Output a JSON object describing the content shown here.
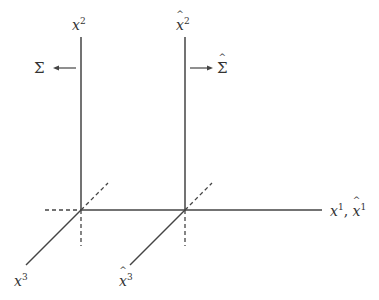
{
  "diagram": {
    "colors": {
      "line": "#444444",
      "text": "#333333",
      "background": "#ffffff"
    },
    "left_system": {
      "vertical_axis_label": "x",
      "vertical_axis_sup": "2",
      "depth_axis_label": "x",
      "depth_axis_sup": "3",
      "surface_label": "Σ",
      "arrow_direction": "left"
    },
    "right_system": {
      "vertical_axis_label": "x",
      "vertical_axis_sup": "2",
      "vertical_axis_hat": true,
      "depth_axis_label": "x",
      "depth_axis_sup": "3",
      "depth_axis_hat": true,
      "surface_label": "Σ",
      "surface_hat": true,
      "arrow_direction": "right"
    },
    "horizontal_axis": {
      "label_1": "x",
      "sup_1": "1",
      "separator": ",",
      "label_2": "x",
      "sup_2": "1",
      "label_2_hat": true
    }
  }
}
